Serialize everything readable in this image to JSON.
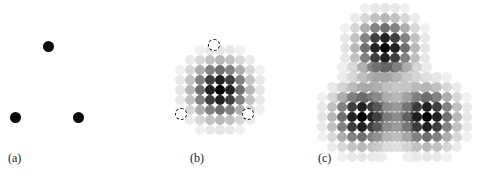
{
  "figure": {
    "width": 477,
    "height": 180,
    "background": "#ffffff"
  },
  "panels": [
    {
      "id": "a",
      "label": "(a)",
      "label_x": 8,
      "label_y": 152,
      "type": "point-sources",
      "content_description": "Three solid black dots arranged in a triangle"
    },
    {
      "id": "b",
      "label": "(b)",
      "label_x": 190,
      "label_y": 152,
      "type": "single-kernel",
      "content_description": "One grayscale dot-grid kernel with three dashed circle markers at source positions"
    },
    {
      "id": "c",
      "label": "(c)",
      "label_x": 318,
      "label_y": 152,
      "type": "superposed-kernels",
      "content_description": "Three overlapping grayscale dot-grid kernels, one centered on each source"
    }
  ],
  "chart_data": {
    "type": "scatter",
    "title": "",
    "xlabel": "",
    "ylabel": "",
    "grid": false,
    "legend": null,
    "colors": {
      "point": "#0a0a0a",
      "kernel_max": "#000000",
      "kernel_min": "#ffffff",
      "marker_stroke": "#141414",
      "background": "#ffffff",
      "label_text": "#1a1a1a"
    },
    "geometry": {
      "cell_pitch": 10,
      "cell_diameter": 10.2,
      "point_dot_diameter": 11,
      "marker_diameter": 12,
      "kernel_radius_cells": 3.6,
      "kernel_falloff": "gaussian"
    },
    "panel_a": {
      "point_diameter": 11,
      "points": [
        {
          "name": "top",
          "x": 48,
          "y": 46
        },
        {
          "name": "bottom-left",
          "x": 15,
          "y": 117
        },
        {
          "name": "bottom-right",
          "x": 78,
          "y": 117
        }
      ]
    },
    "panel_b": {
      "kernel_center": {
        "x": 220,
        "y": 90
      },
      "kernel_cols": 9,
      "kernel_rows": 9,
      "markers": [
        {
          "name": "top",
          "x": 214,
          "y": 45
        },
        {
          "name": "bottom-left",
          "x": 181,
          "y": 114
        },
        {
          "name": "bottom-right",
          "x": 248,
          "y": 114
        }
      ]
    },
    "panel_c": {
      "kernel_cols": 9,
      "kernel_rows": 9,
      "kernel_centers": [
        {
          "name": "top",
          "x": 385,
          "y": 48
        },
        {
          "name": "bottom-left",
          "x": 362,
          "y": 117
        },
        {
          "name": "bottom-right",
          "x": 427,
          "y": 117
        }
      ]
    }
  }
}
